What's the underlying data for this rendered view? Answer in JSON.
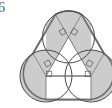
{
  "page": {
    "width": 112,
    "height": 108,
    "background": "#ffffff"
  },
  "label": {
    "problem_number": "6"
  },
  "figure": {
    "stroke_outer": "#6e6e6e",
    "stroke_circle": "#4a4a4a",
    "stroke_inner": "#5a5a5a",
    "stroke_thin": "#707070",
    "fill_sector": "#cccccc",
    "fill_none": "none",
    "outer_stroke_width": 1.6,
    "circle_stroke_width": 1.0,
    "inner_stroke_width": 0.8,
    "mark_stroke_width": 0.7,
    "circles": [
      {
        "name": "top-circle",
        "cx": 68.5,
        "cy": 37.0,
        "r": 26.0
      },
      {
        "name": "bottom-left-circle",
        "cx": 46.0,
        "cy": 76.0,
        "r": 26.0
      },
      {
        "name": "bottom-right-circle",
        "cx": 91.0,
        "cy": 76.0,
        "r": 26.0
      }
    ],
    "centers_triangle": [
      {
        "name": "top-center",
        "x": 68.5,
        "y": 37.0
      },
      {
        "name": "bottom-left-center",
        "x": 46.0,
        "y": 76.0
      },
      {
        "name": "bottom-right-center",
        "x": 91.0,
        "y": 76.0
      }
    ],
    "sectors": [
      {
        "name": "top-sector",
        "fill": "#cccccc"
      },
      {
        "name": "bottom-left-sector",
        "fill": "#cccccc"
      },
      {
        "name": "bottom-right-sector",
        "fill": "#cccccc"
      }
    ],
    "right_angle_marks": [
      {
        "name": "right-angle-top-left",
        "x": 62.0,
        "y": 32.0
      },
      {
        "name": "right-angle-top-right",
        "x": 75.0,
        "y": 32.0
      },
      {
        "name": "right-angle-left-upper",
        "x": 47.5,
        "y": 63.5
      },
      {
        "name": "right-angle-left-lower",
        "x": 47.5,
        "y": 72.5
      },
      {
        "name": "right-angle-right-upper",
        "x": 89.5,
        "y": 63.5
      },
      {
        "name": "right-angle-right-lower",
        "x": 89.5,
        "y": 72.5
      }
    ],
    "rectangle": {
      "name": "base-rectangle",
      "x": 46.0,
      "y": 76.0,
      "width": 45.0,
      "height": 24.0
    }
  }
}
